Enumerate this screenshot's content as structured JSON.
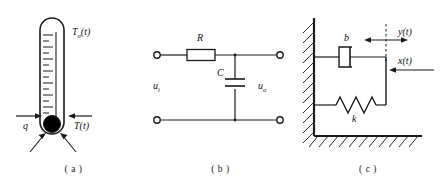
{
  "figure": {
    "panels": [
      {
        "id": "a",
        "caption": "( a )",
        "name": "thermometer-system",
        "labels": {
          "ambient_temp": {
            "symbol": "T",
            "subscript": "o",
            "arg": "(t)"
          },
          "bulb_temp": {
            "symbol": "T",
            "subscript": "",
            "arg": "(t)"
          },
          "heat_flow": {
            "symbol": "q",
            "subscript": "",
            "arg": ""
          }
        },
        "elements": {
          "tube": "thermometer-tube",
          "bulb": "thermometer-bulb",
          "scale_ticks": 16,
          "heat_arrows": 2
        }
      },
      {
        "id": "b",
        "caption": "( b )",
        "name": "rc-circuit",
        "labels": {
          "resistor": {
            "symbol": "R",
            "subscript": "",
            "arg": ""
          },
          "capacitor": {
            "symbol": "C",
            "subscript": "",
            "arg": ""
          },
          "input_voltage": {
            "symbol": "u",
            "subscript": "i",
            "arg": ""
          },
          "output_voltage": {
            "symbol": "u",
            "subscript": "o",
            "arg": ""
          }
        },
        "elements": {
          "input_terminals": 2,
          "output_terminals": 2,
          "topology": "series-R-shunt-C low-pass filter"
        }
      },
      {
        "id": "c",
        "caption": "( c )",
        "name": "spring-damper-system",
        "labels": {
          "damper": {
            "symbol": "b",
            "subscript": "",
            "arg": ""
          },
          "spring": {
            "symbol": "k",
            "subscript": "",
            "arg": ""
          },
          "output_displacement": {
            "symbol": "y",
            "subscript": "",
            "arg": "(t)"
          },
          "input_displacement": {
            "symbol": "x",
            "subscript": "",
            "arg": "(t)"
          }
        },
        "elements": {
          "wall": "fixed-wall-hatched",
          "ground": "fixed-ground-hatched",
          "spring_coils": 4,
          "reference_line": "dashed-vertical"
        }
      }
    ],
    "colors": {
      "line": "#1a1a1a",
      "text": "#111111",
      "background": "#ffffff",
      "fill_dark": "#000000"
    }
  }
}
